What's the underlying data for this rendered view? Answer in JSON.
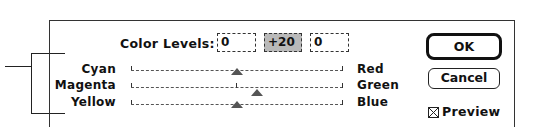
{
  "dialog": {
    "color_levels_label": "Color Levels:",
    "levels": [
      "0",
      "+20",
      "0"
    ],
    "active_level_index": 1,
    "sliders": [
      {
        "left_label": "Cyan",
        "right_label": "Red",
        "value": 0,
        "thumb_pct": 50
      },
      {
        "left_label": "Magenta",
        "right_label": "Green",
        "value": 20,
        "thumb_pct": 60
      },
      {
        "left_label": "Yellow",
        "right_label": "Blue",
        "value": 0,
        "thumb_pct": 50
      }
    ],
    "ok_label": "OK",
    "cancel_label": "Cancel",
    "preview_label": "Preview",
    "preview_checked": true
  }
}
